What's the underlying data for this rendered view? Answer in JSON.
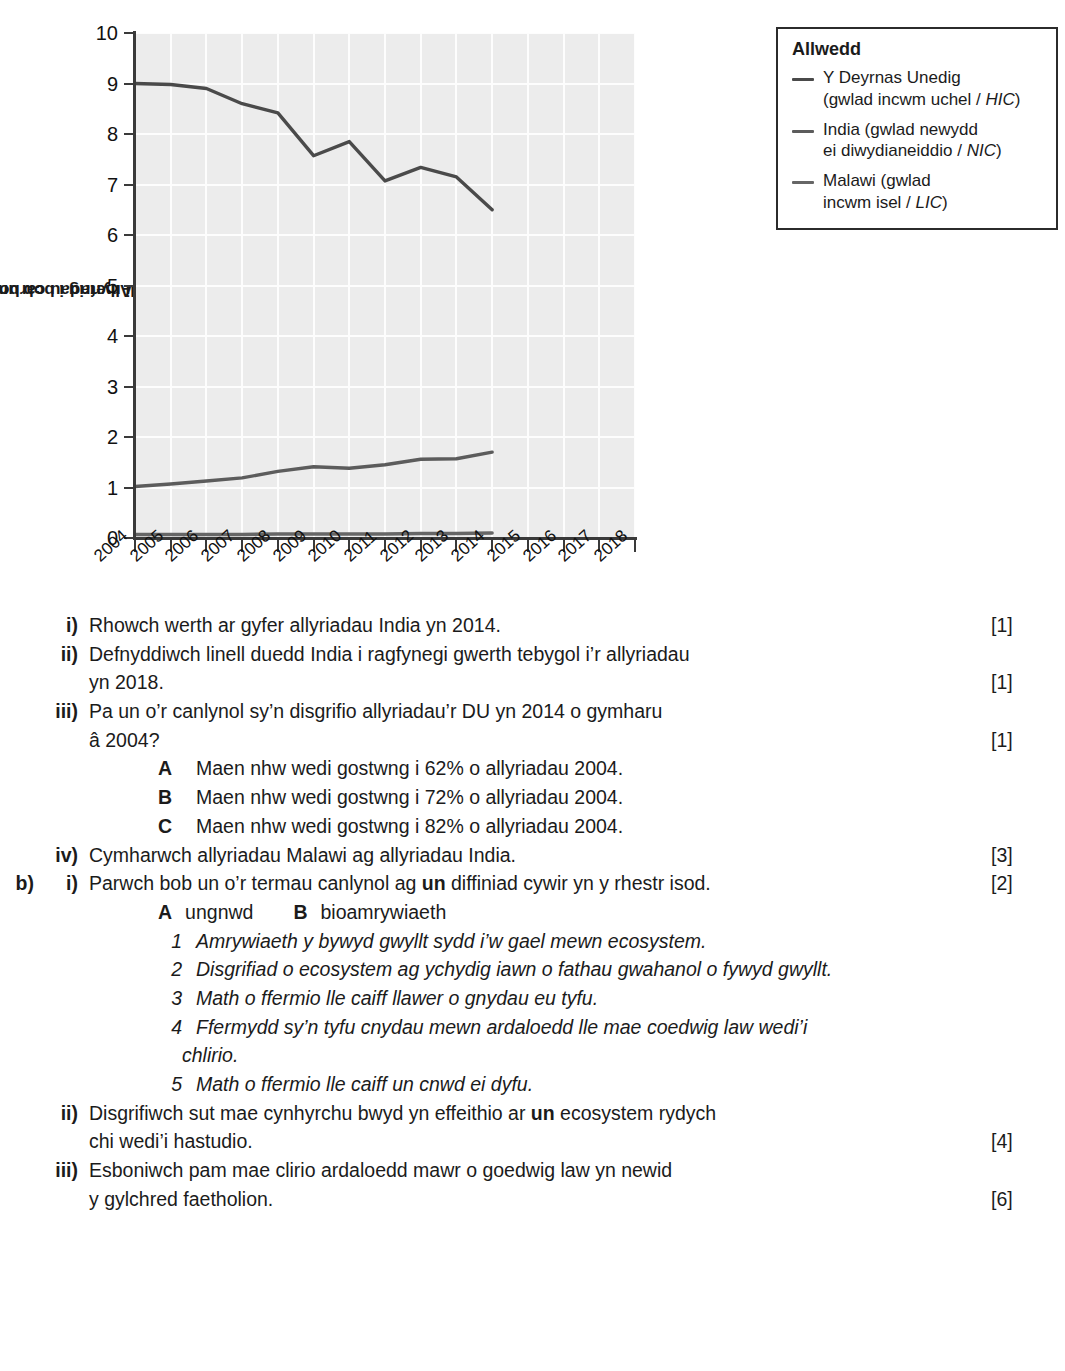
{
  "chart_data": {
    "type": "line",
    "title": "",
    "xlabel": "",
    "ylabel": "Allyriadau carbon deuocsid\n(tunelli metrig i bob unigolyn)",
    "ylabel_line1": "Allyriadau carbon deuocsid",
    "ylabel_line2": "(tunelli metrig i bob unigolyn)",
    "x": [
      2004,
      2005,
      2006,
      2007,
      2008,
      2009,
      2010,
      2011,
      2012,
      2013,
      2014
    ],
    "xticks": [
      "2004",
      "2005",
      "2006",
      "2007",
      "2008",
      "2009",
      "2010",
      "2011",
      "2012",
      "2013",
      "2014",
      "2015",
      "2016",
      "2017",
      "2018"
    ],
    "yticks": [
      "0",
      "1",
      "2",
      "3",
      "4",
      "5",
      "6",
      "7",
      "8",
      "9",
      "10"
    ],
    "xlim": [
      2004,
      2018
    ],
    "ylim": [
      0,
      10
    ],
    "grid": true,
    "legend_position": "top-right",
    "series": [
      {
        "name": "Y Deyrnas Unedig (gwlad incwm uchel / HIC)",
        "color": "#4a4a4a",
        "values": [
          9.0,
          8.98,
          8.9,
          8.6,
          8.42,
          7.57,
          7.85,
          7.07,
          7.34,
          7.15,
          6.5
        ]
      },
      {
        "name": "India (gwlad newydd ei diwydianeiddio / NIC)",
        "color": "#5c5c5c",
        "values": [
          1.02,
          1.07,
          1.13,
          1.19,
          1.32,
          1.41,
          1.38,
          1.45,
          1.56,
          1.57,
          1.7
        ]
      },
      {
        "name": "Malawi (gwlad incwm isel / LIC)",
        "color": "#666666",
        "values": [
          0.07,
          0.07,
          0.07,
          0.07,
          0.08,
          0.08,
          0.08,
          0.08,
          0.09,
          0.09,
          0.1
        ]
      }
    ],
    "plot_background": "#ececec",
    "gridline_color": "#fdfdfd",
    "axis_color": "#3a3a3a"
  },
  "legend": {
    "title": "Allwedd",
    "entries": [
      {
        "swatch_color": "#4a4a4a",
        "line1": "Y Deyrnas Unedig",
        "line2_prefix": "(gwlad incwm uchel / ",
        "line2_italic": "HIC",
        "line2_suffix": ")"
      },
      {
        "swatch_color": "#5c5c5c",
        "line1": "India (gwlad newydd",
        "line2_prefix": "ei diwydianeiddio / ",
        "line2_italic": "NIC",
        "line2_suffix": ")"
      },
      {
        "swatch_color": "#666666",
        "line1": "Malawi (gwlad",
        "line2_prefix": "incwm isel / ",
        "line2_italic": "LIC",
        "line2_suffix": ")"
      }
    ]
  },
  "questions": {
    "a_items": [
      {
        "label": "i)",
        "text": "Rhowch werth ar gyfer allyriadau India yn 2014.",
        "marks": "[1]"
      },
      {
        "label": "ii)",
        "text": "Defnyddiwch linell duedd India i ragfynegi gwerth tebygol i’r allyriadau",
        "text_line2": "yn 2018.",
        "marks": "[1]"
      },
      {
        "label": "iii)",
        "text": "Pa un o’r canlynol sy’n disgrifio allyriadau’r DU yn 2014 o gymharu",
        "text_line2": "â 2004?",
        "marks": "[1]"
      }
    ],
    "a_options": [
      {
        "letter": "A",
        "text": "Maen nhw wedi gostwng i 62% o allyriadau 2004."
      },
      {
        "letter": "B",
        "text": "Maen nhw wedi gostwng i 72% o allyriadau 2004."
      },
      {
        "letter": "C",
        "text": "Maen nhw wedi gostwng i 82% o allyriadau 2004."
      }
    ],
    "a_item_iv": {
      "label": "iv)",
      "text": "Cymharwch allyriadau Malawi ag allyriadau India.",
      "marks": "[3]"
    },
    "b": {
      "label": "b)",
      "i": {
        "label": "i)",
        "text_before": "Parwch bob un o’r termau canlynol ag ",
        "bold": "un",
        "text_after": " diffiniad cywir yn y rhestr isod.",
        "marks": "[2]"
      },
      "terms": [
        {
          "letter": "A",
          "text": "ungnwd"
        },
        {
          "letter": "B",
          "text": "bioamrywiaeth"
        }
      ],
      "definitions": [
        {
          "num": "1",
          "text": "Amrywiaeth y bywyd gwyllt sydd i’w gael mewn ecosystem."
        },
        {
          "num": "2",
          "text": "Disgrifiad o ecosystem ag ychydig iawn o fathau gwahanol o fywyd gwyllt."
        },
        {
          "num": "3",
          "text": "Math o ffermio lle caiff llawer o gnydau eu tyfu."
        },
        {
          "num": "4",
          "text": "Ffermydd sy’n tyfu cnydau mewn ardaloedd lle mae coedwig law wedi’i",
          "text_line2": "chlirio."
        },
        {
          "num": "5",
          "text": "Math o ffermio lle caiff un cnwd ei dyfu."
        }
      ],
      "ii": {
        "label": "ii)",
        "text_before": "Disgrifiwch sut mae cynhyrchu bwyd yn effeithio ar ",
        "bold": "un",
        "text_after": " ecosystem rydych",
        "text_line2": "chi wedi’i hastudio.",
        "marks": "[4]"
      },
      "iii": {
        "label": "iii)",
        "text": "Esboniwch pam mae clirio ardaloedd mawr o goedwig law yn newid",
        "text_line2": "y gylchred faetholion.",
        "marks": "[6]"
      }
    }
  }
}
